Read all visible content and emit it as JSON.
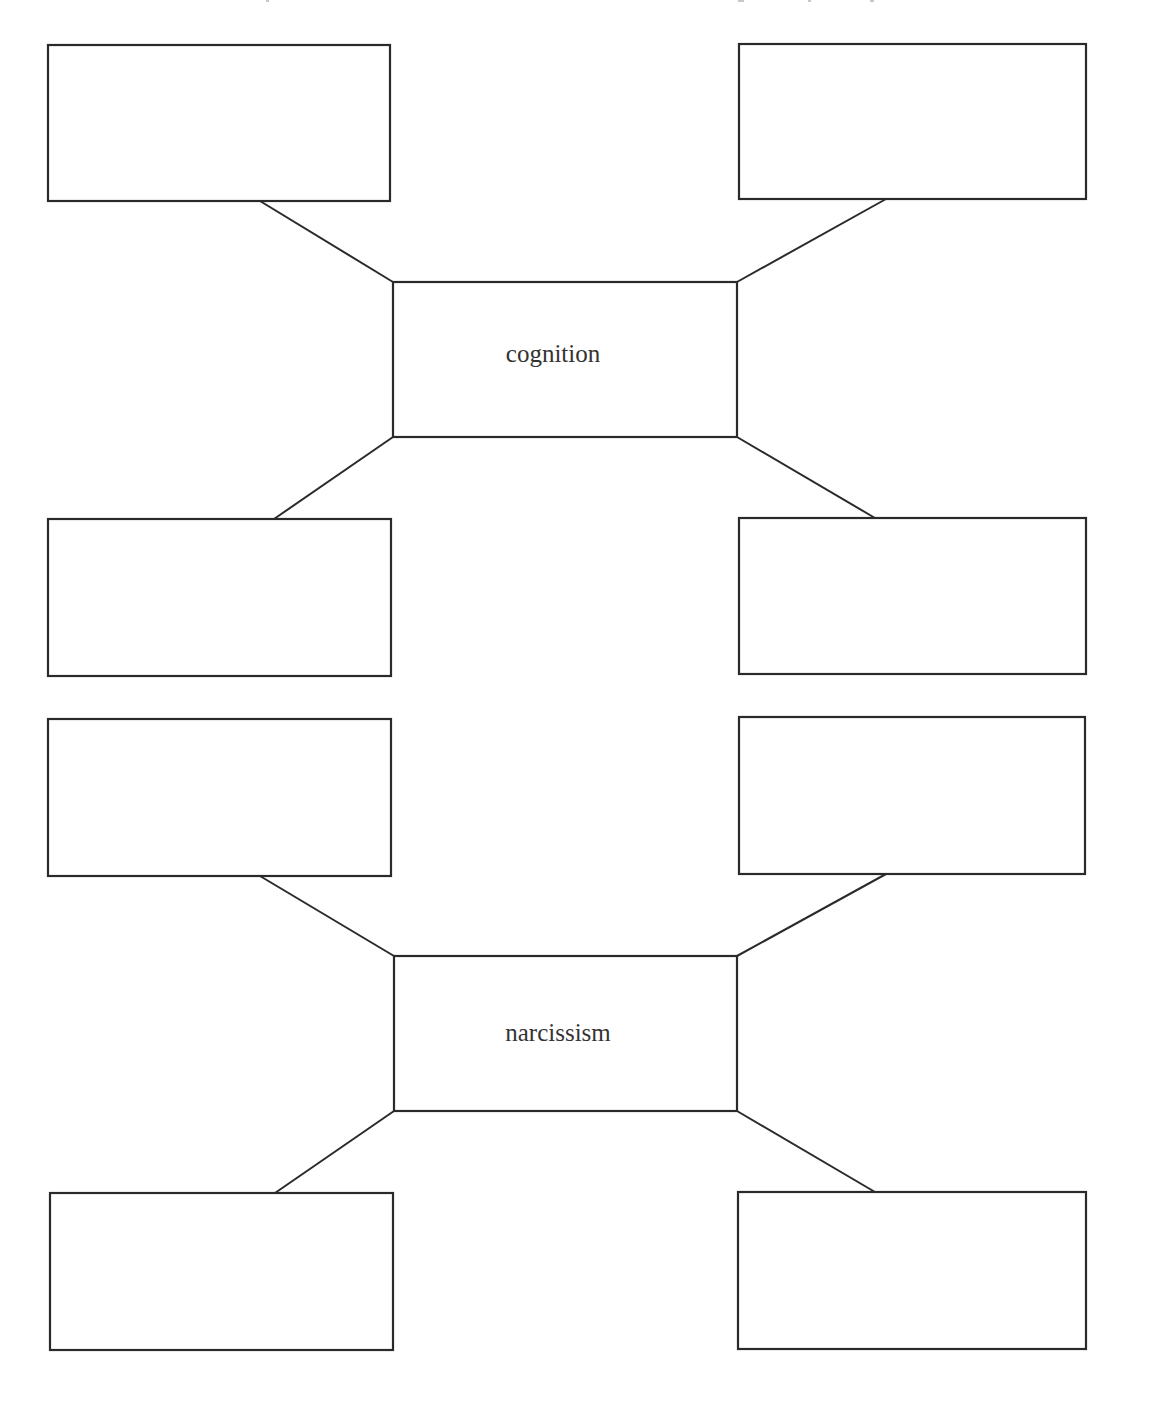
{
  "worksheet": {
    "clusters": [
      {
        "center_label": "cognition",
        "outer_boxes": [
          {
            "position": "top-left",
            "text": ""
          },
          {
            "position": "top-right",
            "text": ""
          },
          {
            "position": "bottom-left",
            "text": ""
          },
          {
            "position": "bottom-right",
            "text": ""
          }
        ]
      },
      {
        "center_label": "narcissism",
        "outer_boxes": [
          {
            "position": "top-left",
            "text": ""
          },
          {
            "position": "top-right",
            "text": ""
          },
          {
            "position": "bottom-left",
            "text": ""
          },
          {
            "position": "bottom-right",
            "text": ""
          }
        ]
      }
    ]
  },
  "colors": {
    "stroke": "#2a2a2a",
    "text": "#333333",
    "background": "#ffffff"
  }
}
